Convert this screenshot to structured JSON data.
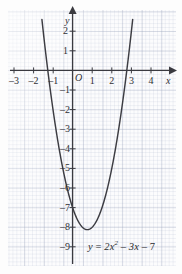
{
  "figure": {
    "name": "quadratic-graph",
    "equation_parts": {
      "y": "y",
      "equals": "=",
      "coef": "2",
      "var": "x",
      "power": "2",
      "minus1": "–",
      "term2": "3x",
      "minus2": "–",
      "const": "7"
    },
    "equation_text": "y = 2x² – 3x – 7"
  },
  "axes": {
    "x_name": "x",
    "y_name": "y",
    "origin_label": "O",
    "x_ticks": [
      "–3",
      "–2",
      "–1",
      "1",
      "2",
      "3",
      "4"
    ],
    "x_tick_values": [
      -3,
      -2,
      -1,
      1,
      2,
      3,
      4
    ],
    "y_ticks": [
      "2",
      "1",
      "–1",
      "–2",
      "–3",
      "–4",
      "–5",
      "–6",
      "–7",
      "–8",
      "–9"
    ],
    "y_tick_values": [
      2,
      1,
      -1,
      -2,
      -3,
      -4,
      -5,
      -6,
      -7,
      -8,
      -9
    ]
  },
  "style": {
    "curve_color": "#3c3c42",
    "axis_color": "#3a3a40",
    "grid_major": "#96a0b9",
    "grid_minor": "#a5afc8",
    "text_color": "#2f2f33",
    "paper": "#fcfcfd"
  },
  "chart_data": {
    "type": "line",
    "title": "",
    "subtitle": "",
    "xlabel": "x",
    "ylabel": "y",
    "xlim": [
      -3.6,
      4.6
    ],
    "ylim": [
      -9.6,
      2.6
    ],
    "grid": true,
    "legend": null,
    "annotations": [
      {
        "text": "y = 2x² – 3x – 7",
        "x": 1.05,
        "y": -8.65
      }
    ],
    "series": [
      {
        "name": "y = 2x² – 3x – 7",
        "equation": "y = 2*x^2 - 3*x - 7",
        "coefficients": {
          "a": 2,
          "b": -3,
          "c": -7
        },
        "vertex": [
          0.75,
          -8.125
        ],
        "y_intercept": -7,
        "x_intercepts": [
          -1.2656,
          2.7656
        ],
        "x": [
          -1.55,
          -1.4,
          -1.2,
          -1.0,
          -0.8,
          -0.6,
          -0.4,
          -0.2,
          0.0,
          0.2,
          0.4,
          0.6,
          0.75,
          0.9,
          1.1,
          1.3,
          1.5,
          1.7,
          1.9,
          2.1,
          2.3,
          2.5,
          2.7,
          2.9,
          3.05
        ],
        "values": [
          2.45,
          1.12,
          -0.52,
          -2.0,
          -3.32,
          -4.48,
          -5.48,
          -6.32,
          -7.0,
          -7.52,
          -7.88,
          -8.08,
          -8.125,
          -8.08,
          -7.88,
          -7.52,
          -7.0,
          -6.32,
          -5.48,
          -4.48,
          -3.32,
          -2.0,
          -0.52,
          1.12,
          2.46
        ]
      }
    ]
  }
}
